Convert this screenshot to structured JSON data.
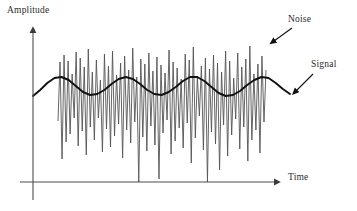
{
  "figure": {
    "title": "",
    "axes": {
      "y_label": "Amplitude",
      "x_label": "Time"
    },
    "annotations": [
      {
        "id": "noise",
        "label": "Noise"
      },
      {
        "id": "signal",
        "label": "Signal"
      }
    ],
    "colors": {
      "axis": "#4d4d4d",
      "signal": "#111111",
      "noise": "#555555",
      "text": "#2b2b2b",
      "background": "#ffffff"
    }
  },
  "chart_data": {
    "type": "line",
    "title": "",
    "xlabel": "Time",
    "ylabel": "Amplitude",
    "grid": false,
    "legend": "annotations",
    "axis_origin": {
      "x": 33,
      "y": 182
    },
    "x_axis_end": {
      "x": 282,
      "y": 182
    },
    "y_axis_end": {
      "x": 33,
      "y": 25
    },
    "xlim": [
      33,
      290
    ],
    "ylim_pixels": [
      182,
      40
    ],
    "series": [
      {
        "name": "Signal",
        "description": "smooth low-frequency sinusoid, thick black line",
        "kind": "sine",
        "x_start": 33,
        "x_end": 290,
        "baseline_y": 86,
        "amplitude_y": 10,
        "period_x": 62,
        "phase_deg": -150,
        "points_y": [
          96,
          90,
          83,
          78,
          77,
          80,
          86,
          92,
          95,
          94,
          90,
          84,
          79,
          77,
          79,
          84,
          90,
          94,
          95,
          92,
          87,
          81,
          77,
          77,
          81,
          87,
          93,
          96,
          95,
          91,
          85,
          80,
          77,
          78,
          83,
          89,
          94
        ]
      },
      {
        "name": "Noise",
        "description": "high-frequency zig-zag noise superimposed on the signal, thin dark-gray line",
        "x_start": 58,
        "x_end": 266,
        "sample_count": 104,
        "values_y": [
          121,
          62,
          159,
          55,
          142,
          61,
          134,
          74,
          118,
          52,
          146,
          58,
          131,
          67,
          155,
          49,
          127,
          72,
          140,
          60,
          118,
          80,
          152,
          54,
          129,
          66,
          147,
          51,
          136,
          75,
          124,
          63,
          158,
          56,
          130,
          70,
          143,
          48,
          122,
          77,
          182,
          59,
          137,
          64,
          151,
          53,
          126,
          71,
          145,
          57,
          179,
          65,
          133,
          73,
          120,
          50,
          154,
          62,
          141,
          68,
          128,
          79,
          148,
          54,
          123,
          60,
          163,
          47,
          138,
          76,
          116,
          66,
          150,
          58,
          182,
          69,
          132,
          55,
          144,
          63,
          170,
          72,
          125,
          51,
          156,
          61,
          135,
          78,
          119,
          53,
          149,
          67,
          127,
          59,
          161,
          46,
          140,
          74,
          130,
          64,
          153,
          56,
          122,
          70
        ]
      }
    ]
  }
}
